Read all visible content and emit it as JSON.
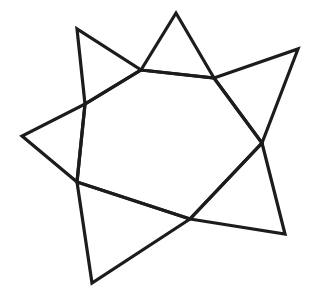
{
  "figure": {
    "stroke_color": "#1c1c1c",
    "background_color": "#ffffff",
    "inner_polygon": [
      [
        141,
        70
      ],
      [
        214,
        78
      ],
      [
        262,
        143
      ],
      [
        190,
        219
      ],
      [
        77,
        182
      ],
      [
        85,
        104
      ]
    ],
    "triangles": [
      {
        "name": "top",
        "base": [
          [
            141,
            70
          ],
          [
            214,
            78
          ]
        ],
        "tip": [
          176,
          13
        ]
      },
      {
        "name": "upper-right",
        "base": [
          [
            214,
            78
          ],
          [
            262,
            143
          ]
        ],
        "tip": [
          298,
          49
        ]
      },
      {
        "name": "lower-right",
        "base": [
          [
            262,
            143
          ],
          [
            190,
            219
          ]
        ],
        "tip": [
          285,
          234
        ]
      },
      {
        "name": "bottom",
        "base": [
          [
            190,
            219
          ],
          [
            77,
            182
          ]
        ],
        "tip": [
          92,
          283
        ]
      },
      {
        "name": "left",
        "base": [
          [
            77,
            182
          ],
          [
            85,
            104
          ]
        ],
        "tip": [
          22,
          136
        ]
      },
      {
        "name": "upper-left",
        "base": [
          [
            85,
            104
          ],
          [
            141,
            70
          ]
        ],
        "tip": [
          77,
          29
        ]
      }
    ]
  }
}
